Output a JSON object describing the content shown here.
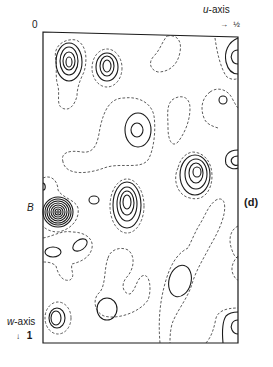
{
  "figure": {
    "panel_label": "(d)",
    "origin_label": "0",
    "u_axis": {
      "label_var": "u",
      "label_suffix": "-axis",
      "arrow": "→",
      "end_value": "½"
    },
    "w_axis": {
      "label_var": "w",
      "label_suffix": "-axis",
      "arrow": "↓",
      "end_value": "1"
    },
    "peak_label": "B",
    "legend": {
      "solid": "positive contours",
      "dashed": "zero / low-level contours"
    },
    "colors": {
      "ink": "#1a1a1a",
      "background": "#ffffff"
    }
  }
}
